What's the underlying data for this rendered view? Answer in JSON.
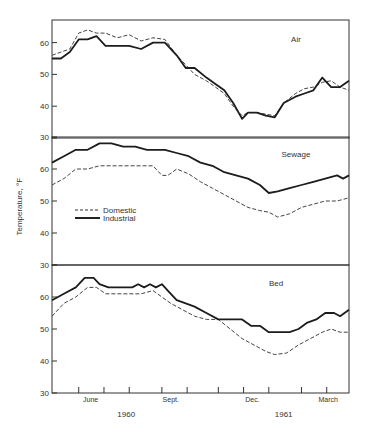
{
  "chart_data": {
    "type": "line",
    "title": "",
    "ylabel": "Temperature, °F",
    "xlabel": "",
    "x_axis": {
      "month_labels": [
        "June",
        "Sept.",
        "Dec.",
        "March"
      ],
      "month_label_pos": [
        0.13,
        0.4,
        0.675,
        0.93
      ],
      "year_labels": [
        "1960",
        "1961"
      ],
      "year_label_pos": [
        0.25,
        0.78
      ],
      "tick_pos": [
        0.09,
        0.175,
        0.26,
        0.37,
        0.455,
        0.56,
        0.645,
        0.73,
        0.84,
        0.925
      ]
    },
    "legend": {
      "position": "inside Sewage panel, lower left",
      "entries": [
        {
          "name": "Domestic",
          "style": "dashed"
        },
        {
          "name": "Industrial",
          "style": "solid"
        }
      ]
    },
    "panels": [
      {
        "name": "Air",
        "ylim": [
          30,
          67
        ],
        "yticks": [
          40,
          50,
          60
        ],
        "series": [
          {
            "name": "Domestic",
            "style": "dashed",
            "x": [
              0,
              0.03,
              0.06,
              0.09,
              0.12,
              0.15,
              0.18,
              0.22,
              0.26,
              0.3,
              0.34,
              0.38,
              0.42,
              0.45,
              0.48,
              0.52,
              0.55,
              0.58,
              0.61,
              0.64,
              0.66,
              0.69,
              0.72,
              0.75,
              0.78,
              0.82,
              0.85,
              0.88,
              0.91,
              0.94,
              0.97,
              1.0
            ],
            "values": [
              56,
              57,
              58,
              63,
              64,
              63,
              63,
              61.5,
              62.5,
              60.5,
              61.5,
              61,
              56,
              53,
              50,
              48,
              46,
              44,
              40,
              37,
              38,
              38,
              37.5,
              37,
              41,
              44,
              45.5,
              46,
              47.5,
              48,
              46,
              45
            ]
          },
          {
            "name": "Industrial",
            "style": "solid",
            "x": [
              0,
              0.03,
              0.06,
              0.09,
              0.12,
              0.15,
              0.18,
              0.22,
              0.26,
              0.3,
              0.34,
              0.38,
              0.42,
              0.45,
              0.48,
              0.52,
              0.55,
              0.58,
              0.61,
              0.64,
              0.66,
              0.69,
              0.72,
              0.75,
              0.78,
              0.82,
              0.85,
              0.88,
              0.91,
              0.94,
              0.97,
              1.0
            ],
            "values": [
              55,
              55,
              57,
              61,
              61,
              62,
              59,
              59,
              59,
              58,
              60,
              60,
              56,
              52,
              52,
              49,
              47,
              45,
              41,
              36,
              38,
              38,
              37,
              36.5,
              41,
              43,
              44,
              45,
              49,
              46,
              46,
              48
            ]
          }
        ]
      },
      {
        "name": "Sewage",
        "ylim": [
          30,
          70
        ],
        "yticks": [
          40,
          50,
          60
        ],
        "ytick_labels_override": {
          "70": "30"
        },
        "series": [
          {
            "name": "Domestic",
            "style": "dashed",
            "x": [
              0,
              0.04,
              0.08,
              0.12,
              0.16,
              0.2,
              0.24,
              0.28,
              0.32,
              0.34,
              0.37,
              0.39,
              0.42,
              0.46,
              0.5,
              0.54,
              0.58,
              0.62,
              0.66,
              0.7,
              0.73,
              0.76,
              0.8,
              0.84,
              0.88,
              0.92,
              0.96,
              1.0
            ],
            "values": [
              55,
              57,
              60,
              60,
              61,
              61,
              61,
              61,
              61,
              61,
              58,
              58,
              60,
              58.5,
              56,
              54,
              52,
              50,
              48,
              47,
              46.5,
              45,
              46,
              48,
              49,
              50,
              50,
              51
            ]
          },
          {
            "name": "Industrial",
            "style": "solid",
            "x": [
              0,
              0.04,
              0.08,
              0.12,
              0.16,
              0.2,
              0.24,
              0.28,
              0.32,
              0.34,
              0.38,
              0.42,
              0.46,
              0.5,
              0.54,
              0.58,
              0.62,
              0.66,
              0.7,
              0.73,
              0.76,
              0.8,
              0.84,
              0.88,
              0.92,
              0.96,
              0.98,
              1.0
            ],
            "values": [
              62,
              64,
              66,
              66,
              68,
              68,
              67,
              67,
              66,
              66,
              66,
              65,
              64,
              62,
              61,
              59,
              58,
              57,
              55,
              52.5,
              53,
              54,
              55,
              56,
              57,
              58,
              57,
              58
            ]
          }
        ]
      },
      {
        "name": "Bed",
        "ylim": [
          30,
          70
        ],
        "yticks": [
          40,
          50,
          60
        ],
        "ytick_labels_override": {
          "70": "30"
        },
        "series": [
          {
            "name": "Domestic",
            "style": "dashed",
            "x": [
              0,
              0.04,
              0.08,
              0.12,
              0.15,
              0.18,
              0.22,
              0.26,
              0.3,
              0.34,
              0.37,
              0.4,
              0.44,
              0.48,
              0.52,
              0.56,
              0.6,
              0.64,
              0.68,
              0.72,
              0.75,
              0.79,
              0.83,
              0.87,
              0.91,
              0.94,
              0.97,
              1.0
            ],
            "values": [
              54,
              58,
              60,
              63,
              63,
              61,
              61,
              61,
              61,
              62,
              60,
              58,
              56,
              54,
              53,
              53,
              50,
              47,
              45,
              43,
              42,
              42.5,
              45,
              47,
              49,
              50,
              49,
              49
            ]
          },
          {
            "name": "Industrial",
            "style": "solid",
            "x": [
              0,
              0.04,
              0.08,
              0.11,
              0.14,
              0.16,
              0.19,
              0.23,
              0.27,
              0.29,
              0.31,
              0.33,
              0.35,
              0.37,
              0.39,
              0.42,
              0.45,
              0.48,
              0.52,
              0.56,
              0.6,
              0.64,
              0.67,
              0.7,
              0.73,
              0.77,
              0.8,
              0.83,
              0.86,
              0.89,
              0.92,
              0.95,
              0.97,
              1.0
            ],
            "values": [
              59,
              61,
              63,
              66,
              66,
              64,
              63,
              63,
              63,
              64,
              63,
              64,
              63,
              64,
              62,
              59,
              58,
              57,
              55,
              53,
              53,
              53,
              51,
              51,
              49,
              49,
              49,
              50,
              52,
              53,
              55,
              55,
              54,
              56
            ]
          }
        ]
      }
    ]
  },
  "labels": {
    "ylabel": "Temperature,",
    "ylabel_unit": "°F"
  }
}
